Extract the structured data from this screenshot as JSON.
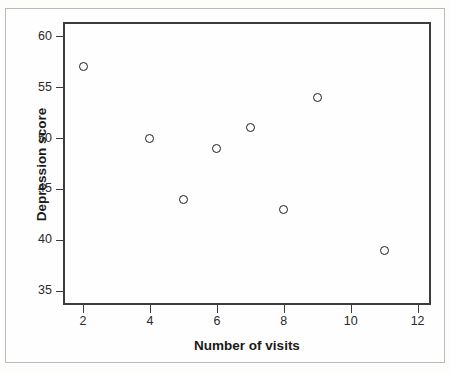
{
  "chart_data": {
    "type": "scatter",
    "title": "",
    "xlabel": "Number of visits",
    "ylabel": "Depression score",
    "xlim": [
      1.4,
      12.4
    ],
    "ylim": [
      33.6,
      61.4
    ],
    "xticks": [
      2,
      4,
      6,
      8,
      10,
      12
    ],
    "yticks": [
      35,
      40,
      45,
      50,
      55,
      60
    ],
    "grid": false,
    "legend": null,
    "marker": "open-circle",
    "marker_color": "#1c1c1c",
    "points": [
      {
        "x": 2,
        "y": 57
      },
      {
        "x": 4,
        "y": 50
      },
      {
        "x": 5,
        "y": 44
      },
      {
        "x": 6,
        "y": 49
      },
      {
        "x": 7,
        "y": 51
      },
      {
        "x": 8,
        "y": 43
      },
      {
        "x": 9,
        "y": 54
      },
      {
        "x": 11,
        "y": 39
      }
    ]
  },
  "figure": {
    "background_color": "#fefefe",
    "border_color": "#b9b9b9",
    "axis_color": "#3c3c3c",
    "text_color": "#2b2b2b"
  }
}
